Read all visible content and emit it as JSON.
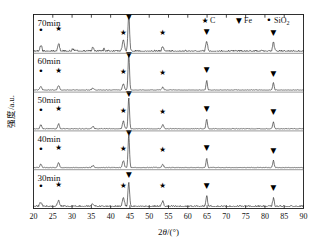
{
  "chart_data": {
    "type": "line",
    "title": "",
    "xlabel": "2θ/(°)",
    "ylabel": "强度/a.u.",
    "xlim": [
      20,
      90
    ],
    "xticks": [
      20,
      25,
      30,
      35,
      40,
      45,
      50,
      55,
      60,
      65,
      70,
      75,
      80,
      85,
      90
    ],
    "xtick_labels": [
      "20",
      "25",
      "30",
      "35",
      "40",
      "45",
      "50",
      "55",
      "60",
      "65",
      "70",
      "75",
      "80",
      "85",
      "90"
    ],
    "grid": false,
    "legend_position": "top-right",
    "legend": [
      {
        "marker": "star",
        "glyph": "★",
        "label": "C"
      },
      {
        "marker": "triangle-down",
        "glyph": "▼",
        "label": "Fe"
      },
      {
        "marker": "dot",
        "glyph": "•",
        "label": "SiO",
        "subscript": "2"
      }
    ],
    "panel_order": "top-to-bottom",
    "series": [
      {
        "name": "70min",
        "label": "70min",
        "noise_level": 0.035,
        "peaks": [
          {
            "x": 21.9,
            "height": 0.16,
            "width": 0.55,
            "phase": "SiO2",
            "marker": "dot",
            "label_offset": 0.3
          },
          {
            "x": 26.5,
            "height": 0.22,
            "width": 0.55,
            "phase": "C",
            "marker": "star",
            "label_offset": 0.3
          },
          {
            "x": 30.2,
            "height": 0.06,
            "width": 0.5,
            "phase": "",
            "marker": "none",
            "label_offset": 0
          },
          {
            "x": 35.4,
            "height": 0.09,
            "width": 0.6,
            "phase": "",
            "marker": "none",
            "label_offset": 0
          },
          {
            "x": 38.3,
            "height": 0.06,
            "width": 0.5,
            "phase": "",
            "marker": "none",
            "label_offset": 0
          },
          {
            "x": 43.3,
            "height": 0.3,
            "width": 0.55,
            "phase": "C",
            "marker": "star",
            "label_offset": 0.12
          },
          {
            "x": 44.7,
            "height": 1.0,
            "width": 0.45,
            "phase": "Fe",
            "marker": "triangle-down",
            "label_offset": 0.02
          },
          {
            "x": 53.5,
            "height": 0.12,
            "width": 0.5,
            "phase": "C",
            "marker": "star",
            "label_offset": 0.28
          },
          {
            "x": 64.9,
            "height": 0.3,
            "width": 0.45,
            "phase": "Fe",
            "marker": "triangle-down",
            "label_offset": 0.13
          },
          {
            "x": 82.2,
            "height": 0.26,
            "width": 0.45,
            "phase": "Fe",
            "marker": "triangle-down",
            "label_offset": 0.14
          }
        ]
      },
      {
        "name": "60min",
        "label": "60min",
        "noise_level": 0.012,
        "peaks": [
          {
            "x": 21.9,
            "height": 0.1,
            "width": 0.5,
            "phase": "SiO2",
            "marker": "dot",
            "label_offset": 0.3
          },
          {
            "x": 26.5,
            "height": 0.13,
            "width": 0.5,
            "phase": "C",
            "marker": "star",
            "label_offset": 0.3
          },
          {
            "x": 35.4,
            "height": 0.05,
            "width": 0.55,
            "phase": "",
            "marker": "none",
            "label_offset": 0
          },
          {
            "x": 43.3,
            "height": 0.18,
            "width": 0.5,
            "phase": "C",
            "marker": "star",
            "label_offset": 0.22
          },
          {
            "x": 44.7,
            "height": 1.0,
            "width": 0.4,
            "phase": "Fe",
            "marker": "triangle-down",
            "label_offset": 0.02
          },
          {
            "x": 53.5,
            "height": 0.08,
            "width": 0.5,
            "phase": "C",
            "marker": "star",
            "label_offset": 0.3
          },
          {
            "x": 64.9,
            "height": 0.26,
            "width": 0.4,
            "phase": "Fe",
            "marker": "triangle-down",
            "label_offset": 0.2
          },
          {
            "x": 82.2,
            "height": 0.2,
            "width": 0.4,
            "phase": "Fe",
            "marker": "triangle-down",
            "label_offset": 0.16
          }
        ]
      },
      {
        "name": "50min",
        "label": "50min",
        "noise_level": 0.014,
        "peaks": [
          {
            "x": 21.9,
            "height": 0.11,
            "width": 0.5,
            "phase": "SiO2",
            "marker": "dot",
            "label_offset": 0.3
          },
          {
            "x": 26.5,
            "height": 0.14,
            "width": 0.5,
            "phase": "C",
            "marker": "star",
            "label_offset": 0.3
          },
          {
            "x": 35.4,
            "height": 0.07,
            "width": 0.6,
            "phase": "",
            "marker": "none",
            "label_offset": 0
          },
          {
            "x": 43.3,
            "height": 0.22,
            "width": 0.5,
            "phase": "C",
            "marker": "star",
            "label_offset": 0.18
          },
          {
            "x": 44.7,
            "height": 0.86,
            "width": 0.4,
            "phase": "Fe",
            "marker": "triangle-down",
            "label_offset": 0.08
          },
          {
            "x": 53.5,
            "height": 0.12,
            "width": 0.5,
            "phase": "C",
            "marker": "star",
            "label_offset": 0.26
          },
          {
            "x": 64.9,
            "height": 0.28,
            "width": 0.4,
            "phase": "Fe",
            "marker": "triangle-down",
            "label_offset": 0.16
          },
          {
            "x": 82.2,
            "height": 0.2,
            "width": 0.4,
            "phase": "Fe",
            "marker": "triangle-down",
            "label_offset": 0.17
          }
        ]
      },
      {
        "name": "40min",
        "label": "40min",
        "noise_level": 0.013,
        "peaks": [
          {
            "x": 21.9,
            "height": 0.1,
            "width": 0.5,
            "phase": "SiO2",
            "marker": "dot",
            "label_offset": 0.3
          },
          {
            "x": 26.5,
            "height": 0.14,
            "width": 0.5,
            "phase": "C",
            "marker": "star",
            "label_offset": 0.3
          },
          {
            "x": 35.4,
            "height": 0.06,
            "width": 0.6,
            "phase": "",
            "marker": "none",
            "label_offset": 0
          },
          {
            "x": 43.3,
            "height": 0.19,
            "width": 0.5,
            "phase": "C",
            "marker": "star",
            "label_offset": 0.22
          },
          {
            "x": 44.7,
            "height": 0.9,
            "width": 0.4,
            "phase": "Fe",
            "marker": "triangle-down",
            "label_offset": 0.06
          },
          {
            "x": 53.5,
            "height": 0.09,
            "width": 0.5,
            "phase": "C",
            "marker": "star",
            "label_offset": 0.29
          },
          {
            "x": 64.9,
            "height": 0.26,
            "width": 0.4,
            "phase": "Fe",
            "marker": "triangle-down",
            "label_offset": 0.2
          },
          {
            "x": 82.2,
            "height": 0.2,
            "width": 0.4,
            "phase": "Fe",
            "marker": "triangle-down",
            "label_offset": 0.17
          }
        ]
      },
      {
        "name": "30min",
        "label": "30min",
        "noise_level": 0.03,
        "peaks": [
          {
            "x": 21.9,
            "height": 0.13,
            "width": 0.6,
            "phase": "SiO2",
            "marker": "dot",
            "label_offset": 0.32
          },
          {
            "x": 26.5,
            "height": 0.16,
            "width": 0.6,
            "phase": "C",
            "marker": "star",
            "label_offset": 0.34
          },
          {
            "x": 35.4,
            "height": 0.07,
            "width": 0.6,
            "phase": "",
            "marker": "none",
            "label_offset": 0
          },
          {
            "x": 43.3,
            "height": 0.26,
            "width": 0.55,
            "phase": "C",
            "marker": "star",
            "label_offset": 0.22
          },
          {
            "x": 44.7,
            "height": 0.66,
            "width": 0.45,
            "phase": "Fe",
            "marker": "triangle-down",
            "label_offset": 0.1
          },
          {
            "x": 53.5,
            "height": 0.14,
            "width": 0.55,
            "phase": "C",
            "marker": "star",
            "label_offset": 0.32
          },
          {
            "x": 64.9,
            "height": 0.3,
            "width": 0.45,
            "phase": "Fe",
            "marker": "triangle-down",
            "label_offset": 0.18
          },
          {
            "x": 82.2,
            "height": 0.22,
            "width": 0.45,
            "phase": "Fe",
            "marker": "triangle-down",
            "label_offset": 0.2
          }
        ]
      }
    ]
  },
  "figure": {
    "y_axis_title": "强度/a.u.",
    "x_axis_title_main": "2",
    "x_axis_title_theta": "θ",
    "x_axis_title_unit": "/(°)"
  }
}
